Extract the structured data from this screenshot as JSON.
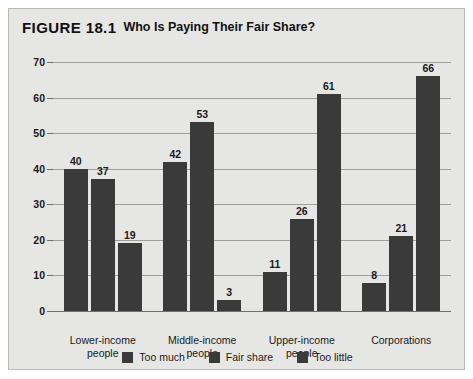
{
  "figure": {
    "label": "FIGURE 18.1",
    "title": "Who Is Paying Their Fair Share?"
  },
  "chart_data": {
    "type": "bar",
    "title": "Who Is Paying Their Fair Share?",
    "xlabel": "",
    "ylabel": "",
    "ylim": [
      0,
      70
    ],
    "yticks": [
      0,
      10,
      20,
      30,
      40,
      50,
      60,
      70
    ],
    "grid": true,
    "legend_position": "bottom",
    "bar_color": "#3a3a3a",
    "categories": [
      "Lower-income\npeople",
      "Middle-income\npeople",
      "Upper-income\npeople",
      "Corporations"
    ],
    "series": [
      {
        "name": "Too much",
        "values": [
          40,
          42,
          11,
          8
        ]
      },
      {
        "name": "Fair share",
        "values": [
          37,
          53,
          26,
          21
        ]
      },
      {
        "name": "Too little",
        "values": [
          19,
          3,
          61,
          66
        ]
      }
    ]
  }
}
